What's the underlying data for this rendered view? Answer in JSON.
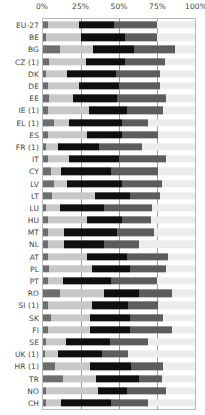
{
  "chart": {
    "title": "",
    "axis": {
      "ticks": [
        "0%",
        "25%",
        "50%",
        "75%",
        "100%"
      ],
      "tick_values": [
        0,
        25,
        50,
        75,
        100
      ]
    }
  },
  "chart_data": {
    "type": "bar",
    "orientation": "horizontal",
    "stacked": true,
    "normalized": true,
    "title": "",
    "subtitle": "",
    "xlabel": "",
    "ylabel": "",
    "xlim": [
      0,
      100
    ],
    "grid": true,
    "gridlines_at": [
      0,
      25,
      50,
      75,
      100
    ],
    "legend": "none",
    "legend_position": "none",
    "tick_labels": [
      "0%",
      "25%",
      "50%",
      "75%",
      "100%"
    ],
    "categories": [
      "EU-27",
      "BE",
      "BG",
      "CZ (1)",
      "DK",
      "DE",
      "EE",
      "IE (1)",
      "EL (1)",
      "ES",
      "FR (1)",
      "IT",
      "CY",
      "LV",
      "LT",
      "LU",
      "HU",
      "MT",
      "NL",
      "AT",
      "PL",
      "PT",
      "RO",
      "SI (1)",
      "SK",
      "FI",
      "SE",
      "UK (1)",
      "HR (1)",
      "TR",
      "NO",
      "CH"
    ],
    "series": [
      {
        "name": "segment-1",
        "color": "#6e6e6e",
        "values": [
          3,
          2,
          11,
          4,
          2,
          3,
          4,
          3,
          7,
          3,
          2,
          3,
          5,
          7,
          6,
          2,
          3,
          3,
          3,
          3,
          4,
          3,
          11,
          3,
          5,
          3,
          2,
          1,
          8,
          13,
          2,
          2
        ]
      },
      {
        "name": "segment-2",
        "color": "#c8c8c8",
        "values": [
          21,
          23,
          22,
          24,
          14,
          21,
          16,
          27,
          10,
          26,
          8,
          14,
          7,
          9,
          28,
          9,
          26,
          11,
          11,
          26,
          28,
          10,
          29,
          29,
          26,
          28,
          13,
          9,
          23,
          22,
          34,
          10
        ]
      },
      {
        "name": "segment-3",
        "color": "#0f0f0f",
        "values": [
          23,
          29,
          27,
          26,
          32,
          26,
          29,
          25,
          35,
          23,
          27,
          33,
          33,
          36,
          23,
          29,
          23,
          35,
          26,
          26,
          25,
          32,
          23,
          24,
          26,
          26,
          29,
          29,
          27,
          28,
          19,
          33
        ]
      },
      {
        "name": "segment-4",
        "color": "#5c5c5c",
        "values": [
          28,
          21,
          27,
          26,
          29,
          27,
          32,
          24,
          17,
          24,
          28,
          31,
          31,
          26,
          20,
          32,
          19,
          24,
          23,
          27,
          24,
          30,
          22,
          20,
          22,
          28,
          25,
          17,
          21,
          15,
          26,
          24
        ]
      },
      {
        "name": "segment-5",
        "color": "#ececec",
        "values": [
          25,
          25,
          13,
          20,
          23,
          23,
          19,
          21,
          31,
          24,
          35,
          19,
          24,
          22,
          23,
          28,
          29,
          27,
          37,
          18,
          19,
          25,
          15,
          24,
          21,
          15,
          31,
          44,
          21,
          22,
          19,
          31
        ]
      }
    ]
  }
}
